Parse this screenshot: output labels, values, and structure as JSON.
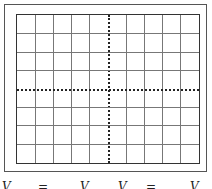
{
  "diagram": {
    "type": "oscilloscope-screen",
    "grid": {
      "columns": 10,
      "rows": 8
    },
    "center_axes": "dotted with tick marks",
    "colors": {
      "grid": "#777777",
      "frame": "#555555",
      "axis": "#222222"
    }
  },
  "captions": [
    {
      "text": "V",
      "x": 2
    },
    {
      "text": "=",
      "x": 38
    },
    {
      "text": "V",
      "x": 80
    },
    {
      "text": "V",
      "x": 118
    },
    {
      "text": "=",
      "x": 146
    },
    {
      "text": "V",
      "x": 190
    }
  ]
}
